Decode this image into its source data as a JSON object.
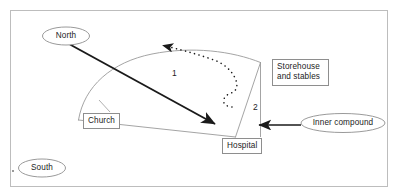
{
  "figure": {
    "title_fragment": "",
    "border_color": "#b4b4b4",
    "line_color": "#8e8e8e",
    "arrow_color": "#1a1a1a",
    "text_color": "#232323",
    "background": "#ffffff"
  },
  "labels": {
    "north": "North",
    "south": "South",
    "inner_compound": "Inner compound",
    "church": "Church",
    "hospital": "Hospital",
    "storehouse_line1": "Storehouse",
    "storehouse_line2": "and stables",
    "number_one": "1",
    "number_two": "2"
  },
  "annotations": {
    "solid_arrow_name": "north-south-axis-arrow",
    "dotted_arrow_name": "circulation-path-arrow",
    "inner_compound_arrow_name": "inner-compound-pointer-arrow"
  }
}
